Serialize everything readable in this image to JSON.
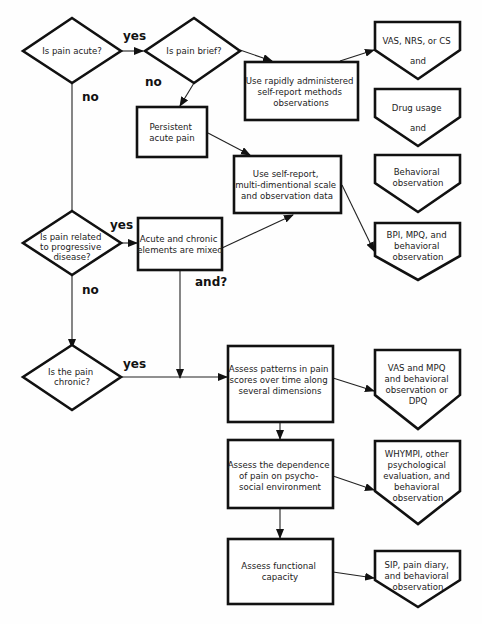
{
  "decisions": {
    "acute": [
      "Is pain acute?"
    ],
    "brief": [
      "Is pain brief?"
    ],
    "progressive": [
      "Is pain related",
      "to progressive",
      "disease?"
    ],
    "chronic": [
      "Is the pain",
      "chronic?"
    ]
  },
  "processes": {
    "rapid": [
      "Use rapidly administered",
      "self-report methods",
      "observations"
    ],
    "persistent": [
      "Persistent",
      "acute pain"
    ],
    "multidim": [
      "Use self-report,",
      "multi-dimentional scale",
      "and observation data"
    ],
    "mixed": [
      "Acute and chronic",
      "elements are mixed"
    ],
    "patterns": [
      "Assess patterns in pain",
      "scores over time along",
      "several dimensions"
    ],
    "dependence": [
      "Assess the dependence",
      "of pain on psycho-",
      "social environment"
    ],
    "functional": [
      "Assess functional",
      "capacity"
    ]
  },
  "outputs": {
    "vas_nrs": [
      "VAS, NRS, or CS",
      "and"
    ],
    "drug": [
      "Drug usage",
      "and"
    ],
    "behavioral": [
      "Behavioral",
      "observation"
    ],
    "bpi": [
      "BPI, MPQ, and",
      "behavioral",
      "observation"
    ],
    "vas_mpq": [
      "VAS and MPQ",
      "and behavioral",
      "observation or",
      "DPQ"
    ],
    "whympi": [
      "WHYMPI, other",
      "psychological",
      "evaluation, and",
      "behavioral",
      "observation"
    ],
    "sip": [
      "SIP, pain diary,",
      "and behavioral",
      "observation"
    ]
  },
  "labels": {
    "acute_yes": "yes",
    "acute_no": "no",
    "brief_no": "no",
    "progressive_yes": "yes",
    "progressive_no": "no",
    "mixed_and": "and?",
    "chronic_yes": "yes"
  }
}
